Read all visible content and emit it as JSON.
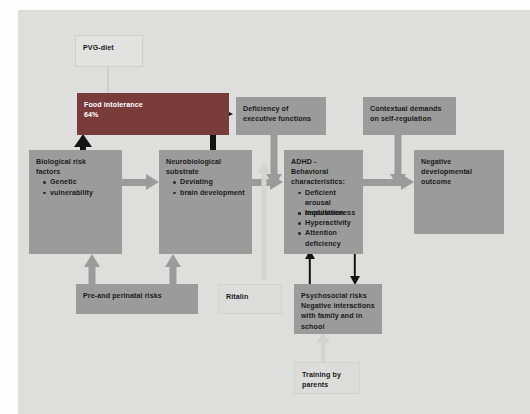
{
  "diagram": {
    "background_color": "#dededd",
    "nodes": {
      "pvg_diet": {
        "label": "PVG-diet",
        "style": "ghost"
      },
      "food_intolerance": {
        "title": "Food intolerance",
        "value": "64%",
        "style": "dark",
        "color": "#7a3b3b"
      },
      "biological_risk": {
        "title_line1": "Biological risk",
        "title_line2": "factors",
        "bullets": [
          "Genetic",
          "vulnerability"
        ],
        "style": "solid"
      },
      "neurobiological_substrate": {
        "title_line1": "Neurobiological",
        "title_line2": "substrate",
        "bullets": [
          "Deviating",
          "brain development"
        ],
        "style": "solid"
      },
      "deficiency_executive": {
        "line1": "Deficiency of",
        "line2": "executive functions",
        "style": "solid"
      },
      "contextual_demands": {
        "line1": "Contextual demands",
        "line2": "on self-regulation",
        "style": "solid"
      },
      "adhd": {
        "title_line1": "ADHD -",
        "title_line2": "Behavioral",
        "title_line3": "characteristics:",
        "bullets": [
          "Deficient arousal",
          "modulation",
          "Impulsiveness",
          "Hyperactivity",
          "Attention deficiency"
        ],
        "style": "solid"
      },
      "negative_outcome": {
        "line1": "Negative",
        "line2": "developmental",
        "line3": "outcome",
        "style": "solid"
      },
      "pre_perinatal": {
        "label": "Pre-and perinatal risks",
        "style": "solid"
      },
      "ritalin": {
        "label": "Ritalin",
        "style": "ghost"
      },
      "psychosocial": {
        "line1": "Psychosocial risks",
        "line2": "Negative interactions",
        "line3": "with family and in",
        "line4": "school",
        "style": "solid"
      },
      "training_parents": {
        "line1": "Training by",
        "line2": "parents",
        "style": "ghost"
      }
    },
    "colors": {
      "solid_box": "#9b9b9b",
      "dark_box": "#7a3b3b",
      "ghost_box": "#e2e2e1",
      "gray_arrow": "#9b9b9b",
      "black_arrow": "#141414",
      "light_arrow": "#cfcfce",
      "text": "#1a1a1a",
      "text_inverse": "#ffffff"
    },
    "edges": [
      {
        "from": "pvg_diet",
        "to": "food_intolerance",
        "style": "light-down"
      },
      {
        "from": "food_intolerance",
        "to": "deficiency_executive",
        "style": "black-right"
      },
      {
        "from": "food_intolerance",
        "to": "neurobiological_substrate",
        "style": "black-down"
      },
      {
        "from": "biological_risk",
        "to": "food_intolerance",
        "style": "black-up"
      },
      {
        "from": "biological_risk",
        "to": "neurobiological_substrate",
        "style": "gray-right"
      },
      {
        "from": "neurobiological_substrate",
        "to": "adhd",
        "style": "gray-right"
      },
      {
        "from": "deficiency_executive",
        "to": "adhd",
        "style": "gray-down"
      },
      {
        "from": "pre_perinatal",
        "to": "biological_risk",
        "style": "gray-up"
      },
      {
        "from": "pre_perinatal",
        "to": "neurobiological_substrate",
        "style": "gray-up"
      },
      {
        "from": "ritalin",
        "to": "adhd",
        "style": "light-up"
      },
      {
        "from": "psychosocial",
        "to": "adhd",
        "style": "black-up"
      },
      {
        "from": "adhd",
        "to": "psychosocial",
        "style": "black-down"
      },
      {
        "from": "training_parents",
        "to": "psychosocial",
        "style": "light-up"
      },
      {
        "from": "contextual_demands",
        "to": "negative_outcome",
        "style": "gray-down"
      },
      {
        "from": "adhd",
        "to": "negative_outcome",
        "style": "gray-right"
      }
    ]
  }
}
